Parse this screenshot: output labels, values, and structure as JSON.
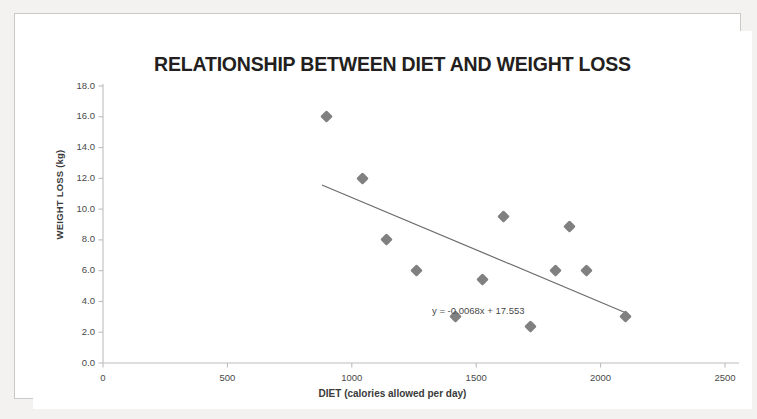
{
  "chart_data": {
    "type": "scatter",
    "title": "RELATIONSHIP BETWEEN DIET AND WEIGHT LOSS",
    "xlabel": "DIET (calories allowed per day)",
    "ylabel": "WEIGHT LOSS (kg)",
    "xlim": [
      0,
      2500
    ],
    "ylim": [
      0,
      18
    ],
    "xticks": [
      0,
      500,
      1000,
      1500,
      2000,
      2500
    ],
    "yticks": [
      0.0,
      2.0,
      4.0,
      6.0,
      8.0,
      10.0,
      12.0,
      14.0,
      16.0,
      18.0
    ],
    "xtick_labels": [
      "0",
      "500",
      "1000",
      "1500",
      "2000",
      "2500"
    ],
    "ytick_labels": [
      "0.0",
      "2.0",
      "4.0",
      "6.0",
      "8.0",
      "10.0",
      "12.0",
      "14.0",
      "16.0",
      "18.0"
    ],
    "grid": false,
    "legend": "none",
    "marker_shape": "diamond",
    "marker_color": "#808080",
    "trendline_color": "#6b6b6b",
    "axis_color": "#bdbdbd",
    "title_color": "#231f20",
    "x": [
      900,
      1045,
      1140,
      1262,
      1415,
      1525,
      1610,
      1720,
      1820,
      1875,
      1945,
      2100,
      2210
    ],
    "y": [
      16.0,
      12.0,
      8.0,
      6.0,
      3.0,
      5.4,
      9.5,
      2.4,
      6.0,
      8.9,
      6.0,
      3.0,
      3.0
    ],
    "points": [
      {
        "x": 900,
        "y": 16.0
      },
      {
        "x": 1045,
        "y": 12.0
      },
      {
        "x": 1140,
        "y": 8.0
      },
      {
        "x": 1262,
        "y": 6.0
      },
      {
        "x": 1415,
        "y": 3.0
      },
      {
        "x": 1525,
        "y": 5.4
      },
      {
        "x": 1610,
        "y": 9.5
      },
      {
        "x": 1720,
        "y": 2.4
      },
      {
        "x": 1820,
        "y": 6.0
      },
      {
        "x": 1875,
        "y": 8.9
      },
      {
        "x": 1945,
        "y": 6.0
      },
      {
        "x": 2100,
        "y": 3.0
      }
    ],
    "trendline": {
      "equation": "y = -0.0068x + 17.553",
      "slope": -0.0068,
      "intercept": 17.553,
      "x_start": 880,
      "x_end": 2110
    },
    "annotations": [
      {
        "text": "y = -0.0068x + 17.553",
        "x": 1620,
        "y": 3.35
      }
    ]
  }
}
